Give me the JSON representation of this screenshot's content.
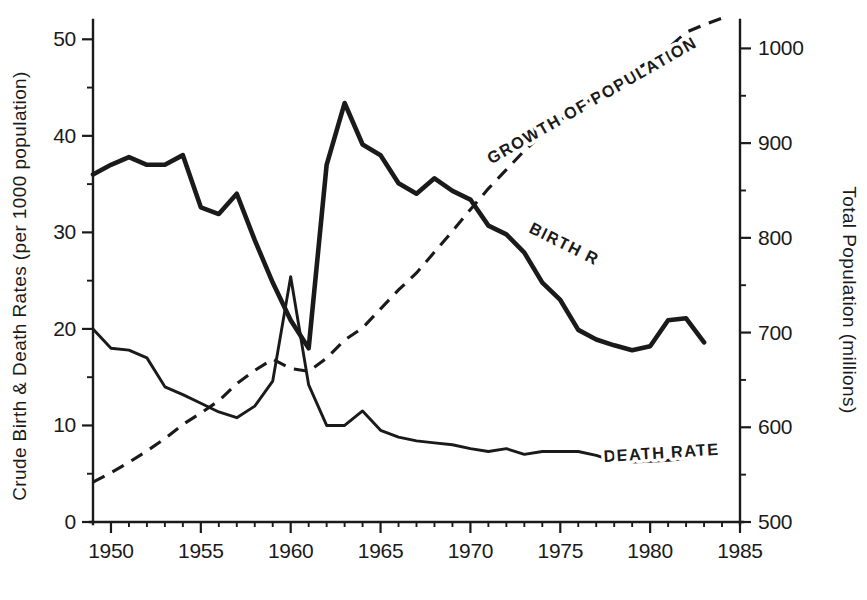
{
  "chart_data": {
    "type": "line",
    "title": "",
    "subtitle": "",
    "xlabel": "",
    "ylabel": "Crude Birth & Death Rates  (per 1000 population)",
    "y2label": "Total Population  (millions)",
    "xlim": [
      1949,
      1985
    ],
    "ylim": [
      0,
      52
    ],
    "y2lim": [
      500,
      1030
    ],
    "grid": false,
    "legend_position": "inline-curve-labels",
    "x_ticks": [
      1950,
      1955,
      1960,
      1965,
      1970,
      1975,
      1980,
      1985
    ],
    "x_tick_labels": [
      "1950",
      "1955",
      "1960",
      "1965",
      "1970",
      "1975",
      "1980",
      "1985"
    ],
    "x_minor_ticks": [
      1951,
      1952,
      1953,
      1954,
      1956,
      1957,
      1958,
      1959,
      1961,
      1962,
      1963,
      1964,
      1966,
      1967,
      1968,
      1969,
      1971,
      1972,
      1973,
      1974,
      1976,
      1977,
      1978,
      1979,
      1981,
      1982,
      1983,
      1984
    ],
    "y_ticks": [
      0,
      10,
      20,
      30,
      40,
      50
    ],
    "y_tick_labels": [
      "0",
      "10",
      "20",
      "30",
      "40",
      "50"
    ],
    "y_minor_ticks": [
      5,
      15,
      25,
      35,
      45
    ],
    "y2_ticks": [
      500,
      600,
      700,
      800,
      900,
      1000
    ],
    "y2_tick_labels": [
      "500",
      "600",
      "700",
      "800",
      "900",
      "1000"
    ],
    "y2_minor_ticks": [
      550,
      650,
      750,
      850,
      950
    ],
    "series": [
      {
        "name": "BIRTH RATE",
        "label": "BIRTH RATE",
        "style": "solid-thick",
        "axis": "left",
        "x": [
          1949,
          1950,
          1951,
          1952,
          1953,
          1954,
          1955,
          1956,
          1957,
          1958,
          1959,
          1960,
          1961,
          1962,
          1963,
          1964,
          1965,
          1966,
          1967,
          1968,
          1969,
          1970,
          1971,
          1972,
          1973,
          1974,
          1975,
          1976,
          1977,
          1978,
          1979,
          1980,
          1981,
          1982,
          1983
        ],
        "values": [
          36.0,
          37.0,
          37.8,
          37.0,
          37.0,
          38.0,
          32.6,
          31.9,
          34.0,
          29.2,
          24.8,
          20.9,
          18.0,
          37.0,
          43.4,
          39.1,
          38.0,
          35.1,
          34.0,
          35.6,
          34.3,
          33.4,
          30.7,
          29.8,
          27.9,
          24.8,
          23.0,
          19.9,
          18.9,
          18.3,
          17.8,
          18.2,
          20.9,
          21.1,
          18.6
        ]
      },
      {
        "name": "DEATH RATE",
        "label": "DEATH RATE",
        "style": "solid-thin",
        "axis": "left",
        "x": [
          1949,
          1950,
          1951,
          1952,
          1953,
          1954,
          1955,
          1956,
          1957,
          1958,
          1959,
          1960,
          1961,
          1962,
          1963,
          1964,
          1965,
          1966,
          1967,
          1968,
          1969,
          1970,
          1971,
          1972,
          1973,
          1974,
          1975,
          1976,
          1977,
          1978,
          1979,
          1980,
          1981,
          1982,
          1983
        ],
        "values": [
          20.0,
          18.0,
          17.8,
          17.0,
          14.0,
          13.2,
          12.3,
          11.4,
          10.8,
          12.0,
          14.6,
          25.4,
          14.2,
          10.0,
          10.0,
          11.5,
          9.5,
          8.8,
          8.4,
          8.2,
          8.0,
          7.6,
          7.3,
          7.6,
          7.0,
          7.3,
          7.3,
          7.3,
          6.9,
          6.3,
          6.2,
          6.3,
          6.4,
          6.6,
          7.1
        ]
      },
      {
        "name": "GROWTH OF POPULATION",
        "label": "GROWTH OF POPULATION",
        "style": "dashed",
        "axis": "right",
        "x": [
          1949,
          1950,
          1951,
          1952,
          1953,
          1954,
          1955,
          1956,
          1957,
          1958,
          1959,
          1960,
          1961,
          1962,
          1963,
          1964,
          1965,
          1966,
          1967,
          1968,
          1969,
          1970,
          1971,
          1972,
          1973,
          1974,
          1975,
          1976,
          1977,
          1978,
          1979,
          1980,
          1981,
          1982,
          1983,
          1984
        ],
        "values": [
          542,
          552,
          563,
          575,
          588,
          603,
          615,
          628,
          646,
          660,
          672,
          662,
          659,
          673,
          692,
          705,
          725,
          745,
          763,
          785,
          807,
          830,
          852,
          872,
          892,
          909,
          924,
          937,
          950,
          963,
          975,
          987,
          1000,
          1017,
          1025,
          1032
        ]
      }
    ],
    "annotations": [
      {
        "text": "GROWTH OF POPULATION",
        "for": "GROWTH OF POPULATION"
      },
      {
        "text": "BIRTH RATE",
        "for": "BIRTH RATE"
      },
      {
        "text": "DEATH RATE",
        "for": "DEATH RATE"
      }
    ]
  }
}
